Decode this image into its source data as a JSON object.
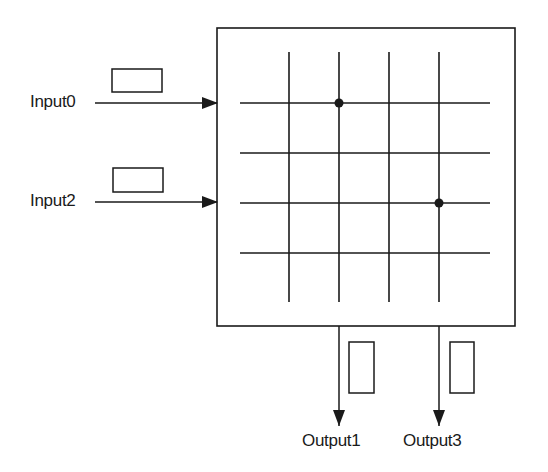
{
  "diagram": {
    "colors": {
      "stroke": "#1a1a1a",
      "background": "#ffffff"
    },
    "switch_box": {
      "x": 217,
      "y": 28,
      "width": 298,
      "height": 298
    },
    "grid": {
      "vertical_x": [
        289,
        339,
        389,
        439
      ],
      "vertical_y_range": [
        52,
        302
      ],
      "horizontal_y": [
        103,
        153,
        203,
        253
      ],
      "horizontal_x_range": [
        240,
        490
      ]
    },
    "crosspoints": [
      {
        "name": "Input0-Output1",
        "x": 339,
        "y": 103
      },
      {
        "name": "Input2-Output3",
        "x": 439,
        "y": 203
      }
    ],
    "inputs": [
      {
        "label": "Input0",
        "label_x": 30,
        "y": 103,
        "arrow_from": 95,
        "arrow_to": 217,
        "buffer": {
          "x": 112,
          "y": 69,
          "width": 50,
          "height": 23
        }
      },
      {
        "label": "Input2",
        "label_x": 30,
        "y": 202,
        "arrow_from": 95,
        "arrow_to": 217,
        "buffer": {
          "x": 113,
          "y": 168,
          "width": 50,
          "height": 24
        }
      }
    ],
    "outputs": [
      {
        "label": "Output1",
        "label_x": 302,
        "x": 339,
        "arrow_from": 326,
        "arrow_to": 426,
        "buffer": {
          "x": 349,
          "y": 342,
          "width": 25,
          "height": 51
        }
      },
      {
        "label": "Output3",
        "label_x": 403,
        "x": 439,
        "arrow_from": 326,
        "arrow_to": 426,
        "buffer": {
          "x": 450,
          "y": 342,
          "width": 24,
          "height": 51
        }
      }
    ]
  }
}
